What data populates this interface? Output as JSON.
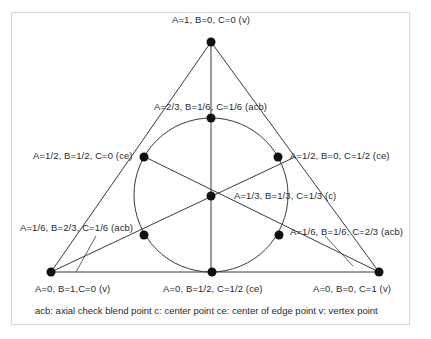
{
  "diagram": {
    "type": "simplex-lattice mixture design (triangle with inscribed circle)",
    "points": [
      {
        "id": "top-vertex",
        "label": "A=1, B=0, C=0 (v)",
        "A": "1",
        "B": "0",
        "C": "0",
        "kind": "v"
      },
      {
        "id": "acb-top",
        "label": "A=2/3, B=1/6, C=1/6 (acb)",
        "A": "2/3",
        "B": "1/6",
        "C": "1/6",
        "kind": "acb"
      },
      {
        "id": "ce-left",
        "label": "A=1/2, B=1/2, C=0 (ce)",
        "A": "1/2",
        "B": "1/2",
        "C": "0",
        "kind": "ce"
      },
      {
        "id": "ce-right",
        "label": "A=1/2, B=0, C=1/2 (ce)",
        "A": "1/2",
        "B": "0",
        "C": "1/2",
        "kind": "ce"
      },
      {
        "id": "center",
        "label": "A=1/3, B=1/3, C=1/3 (c)",
        "A": "1/3",
        "B": "1/3",
        "C": "1/3",
        "kind": "c"
      },
      {
        "id": "acb-left",
        "label": "A=1/6, B=2/3, C=1/6 (acb)",
        "A": "1/6",
        "B": "2/3",
        "C": "1/6",
        "kind": "acb"
      },
      {
        "id": "acb-right",
        "label": "A=1/6, B=1/6, C=2/3 (acb)",
        "A": "1/6",
        "B": "1/6",
        "C": "2/3",
        "kind": "acb"
      },
      {
        "id": "bottom-left-vertex",
        "label": "A=0, B=1,C=0 (v)",
        "A": "0",
        "B": "1",
        "C": "0",
        "kind": "v"
      },
      {
        "id": "ce-bottom",
        "label": "A=0, B=1/2, C=1/2 (ce)",
        "A": "0",
        "B": "1/2",
        "C": "1/2",
        "kind": "ce"
      },
      {
        "id": "bottom-right-vertex",
        "label": "A=0, B=0, C=1 (v)",
        "A": "0",
        "B": "0",
        "C": "1",
        "kind": "v"
      }
    ],
    "legend": "acb: axial check blend point  c: center point  ce: center of edge point  v: vertex point",
    "colors": {
      "line": "#3a3a3a",
      "point": "#111111",
      "frame": "#d8d8d8",
      "text": "#2a2a2a"
    }
  }
}
